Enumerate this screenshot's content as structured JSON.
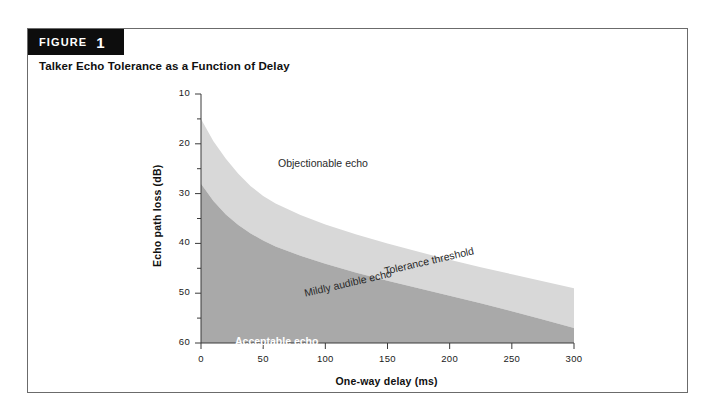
{
  "figure": {
    "badge_word": "FIGURE",
    "badge_number": "1",
    "title": "Talker Echo Tolerance as a Function of Delay"
  },
  "colors": {
    "border": "#6b6b6b",
    "badge_bg": "#0d0d0d",
    "acceptable_fill": "#a9a9a9",
    "mildly_fill": "#d8d8d8",
    "objectionable_fill": "#ffffff",
    "axis": "#3a3a3a",
    "text": "#1a1a1a"
  },
  "chart_data": {
    "type": "area",
    "title": "Talker Echo Tolerance as a Function of Delay",
    "xlabel": "One-way delay (ms)",
    "ylabel": "Echo path loss (dB)",
    "xlim": [
      0,
      300
    ],
    "ylim": [
      10,
      60
    ],
    "y_inverted": true,
    "grid": false,
    "legend_position": "inline-annotations",
    "x_ticks": [
      0,
      50,
      100,
      150,
      200,
      250,
      300
    ],
    "x_tick_labels": [
      "0",
      "50",
      "100",
      "150",
      "200",
      "250",
      "300"
    ],
    "y_ticks": [
      10,
      20,
      30,
      40,
      50,
      60
    ],
    "y_tick_labels": [
      "10",
      "20",
      "30",
      "40",
      "50",
      "60"
    ],
    "y_minor_ticks": [
      15,
      25,
      35,
      45,
      55
    ],
    "series": [
      {
        "name": "Tolerance threshold",
        "role": "upper-boundary",
        "x": [
          0,
          10,
          20,
          30,
          40,
          50,
          60,
          80,
          100,
          125,
          150,
          175,
          200,
          225,
          250,
          275,
          300
        ],
        "values": [
          15.0,
          19.5,
          23.0,
          26.0,
          28.5,
          30.5,
          32.0,
          34.3,
          36.2,
          38.2,
          40.0,
          41.7,
          43.3,
          44.8,
          46.2,
          47.6,
          49.0
        ]
      },
      {
        "name": "Mildly audible echo lower boundary",
        "role": "lower-boundary",
        "x": [
          0,
          10,
          20,
          30,
          40,
          50,
          60,
          80,
          100,
          125,
          150,
          175,
          200,
          225,
          250,
          275,
          300
        ],
        "values": [
          28.0,
          31.5,
          34.2,
          36.3,
          38.0,
          39.4,
          40.6,
          42.5,
          44.1,
          45.9,
          47.5,
          49.0,
          50.5,
          52.0,
          53.6,
          55.3,
          57.0
        ]
      }
    ],
    "regions": [
      {
        "label": "Objectionable echo",
        "fill": "#ffffff",
        "text_color": "#2a2a2a",
        "rotation_deg": 0
      },
      {
        "label": "Mildly audible echo",
        "fill": "#d8d8d8",
        "text_color": "#2a2a2a",
        "rotation_deg": -13
      },
      {
        "label": "Acceptable echo",
        "fill": "#a9a9a9",
        "text_color": "#ffffff",
        "rotation_deg": 0
      }
    ],
    "annotations": [
      {
        "label": "Tolerance threshold",
        "rotation_deg": -13,
        "text_color": "#2a2a2a"
      }
    ]
  }
}
